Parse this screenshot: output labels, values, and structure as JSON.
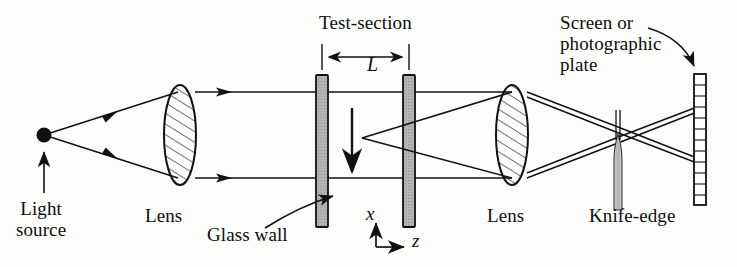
{
  "figure": {
    "width": 737,
    "height": 267,
    "background_color": "#fdfdfc",
    "ink_color": "#111111",
    "glass_fill_color": "#b0b0b0",
    "knife_edge_fill_color": "#b8b8b8"
  },
  "labels": {
    "light_source": "Light\nsource",
    "lens_left": "Lens",
    "glass_wall": "Glass wall",
    "test_section": "Test-section",
    "length_L": "L",
    "axis_x": "x",
    "axis_z": "z",
    "lens_right": "Lens",
    "screen": "Screen or\nphotographic\nplate",
    "knife_edge": "Knife-edge"
  },
  "components": [
    {
      "name": "light-source",
      "label": "Light source",
      "type": "point-source",
      "x": 44,
      "y": 135
    },
    {
      "name": "lens-left",
      "label": "Lens",
      "type": "converging-lens",
      "x": 180,
      "y": 135
    },
    {
      "name": "glass-wall-left",
      "label": "Glass wall",
      "type": "glass-wall",
      "x": 322,
      "y": 135
    },
    {
      "name": "glass-wall-right",
      "label": "Glass wall",
      "type": "glass-wall",
      "x": 409,
      "y": 135
    },
    {
      "name": "lens-right",
      "label": "Lens",
      "type": "converging-lens",
      "x": 512,
      "y": 135
    },
    {
      "name": "knife-edge",
      "label": "Knife-edge",
      "type": "knife-edge",
      "x": 618,
      "y": 140
    },
    {
      "name": "screen",
      "label": "Screen or photographic plate",
      "type": "screen",
      "x": 699,
      "y": 135
    }
  ],
  "annotations": {
    "test_section_dimension": {
      "symbol": "L",
      "from_x": 322,
      "to_x": 409
    },
    "flow_arrow": {
      "direction": "down",
      "x": 352,
      "from_y": 110,
      "to_y": 175
    },
    "axes": {
      "x_direction": "up",
      "z_direction": "right",
      "origin_x": 376,
      "origin_y": 245
    },
    "pointer_glass_wall": {
      "from": "Glass wall label",
      "to": "glass-wall-left"
    },
    "pointer_screen": {
      "from": "Screen or photographic plate label",
      "to": "screen"
    },
    "pointer_light_source": {
      "from": "Light source label",
      "to": "light-source"
    }
  },
  "beam": {
    "upper_ray_y": 92,
    "lower_ray_y": 178,
    "disturbance_vertex": {
      "x": 362,
      "y": 138
    },
    "focal_point": {
      "x": 618,
      "y": 133
    }
  }
}
